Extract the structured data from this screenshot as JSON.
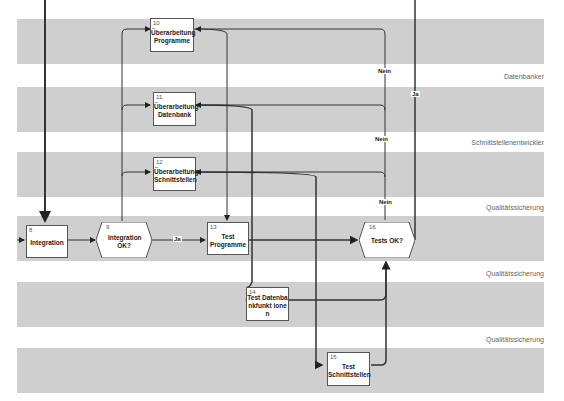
{
  "lanes": [
    {
      "label": ""
    },
    {
      "label": "Datenbanker"
    },
    {
      "label": "Schnittstellenentwickler"
    },
    {
      "label": "Qualitätssicherung"
    },
    {
      "label": "Qualitätssicherung"
    },
    {
      "label": "Qualitätssicherung"
    }
  ],
  "nodes": {
    "n8": {
      "num": "8",
      "text": "Integration"
    },
    "n9": {
      "num": "9",
      "text": "Integration OK?"
    },
    "n10": {
      "num": "10",
      "text": "Überarbeitung Programme"
    },
    "n11": {
      "num": "11",
      "text": "Überarbeitung Datenbank"
    },
    "n12": {
      "num": "12",
      "text": "Überarbeitung Schnittstellen"
    },
    "n13": {
      "num": "13",
      "text": "Test Programme"
    },
    "n14": {
      "num": "14",
      "text": "Test Datenbankfunkt ionen"
    },
    "n15": {
      "num": "15",
      "text": "Test Schnittstellen"
    },
    "n16": {
      "num": "16",
      "text": "Tests OK?"
    }
  },
  "edge_labels": {
    "ja1": "Ja",
    "ja2": "Ja",
    "nein1": "Nein",
    "nein2": "Nein",
    "nein3": "Nein"
  },
  "colors": {
    "band": "#cfcfcf",
    "line": "#333333"
  }
}
